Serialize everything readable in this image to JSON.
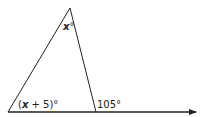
{
  "diagram": {
    "type": "triangle-exterior-angle",
    "colors": {
      "stroke": "#222222",
      "background": "#ffffff"
    },
    "vertices": {
      "apex": [
        70,
        8
      ],
      "left_base": [
        8,
        112
      ],
      "right_base": [
        96,
        112
      ]
    },
    "baseline_arrow_end": [
      197,
      112
    ],
    "labels": {
      "apex_angle": {
        "var": "x",
        "suffix": "°"
      },
      "left_angle": {
        "open": "(",
        "var": "x",
        "rest": " + 5)°"
      },
      "exterior_angle": "105°"
    }
  }
}
